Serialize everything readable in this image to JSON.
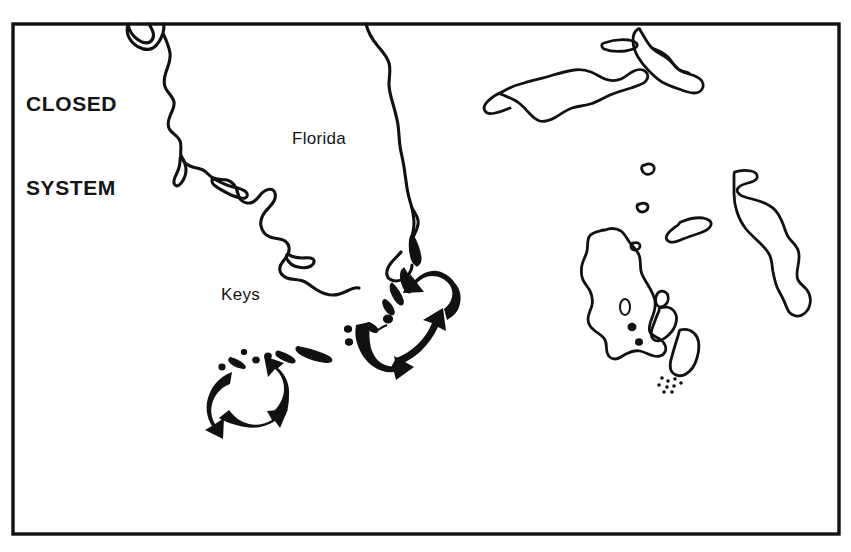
{
  "figure": {
    "kind": "line-drawing-map",
    "caption_title": "CLOSED SYSTEM",
    "title_line_1": "CLOSED",
    "title_line_2": "SYSTEM",
    "background_color": "#ffffff",
    "ink_color": "#111111",
    "border_color": "#111111",
    "width": 851,
    "height": 552
  },
  "labels": {
    "florida": "Florida",
    "keys": "Keys"
  },
  "map_features": {
    "coastlines": [
      "west-florida-coast",
      "east-florida-coast",
      "florida-keys-chain",
      "grand-bahama",
      "little-bahama-bank-cay",
      "abaco",
      "eleuthera",
      "andros",
      "new-providence",
      "exuma-cays",
      "small-cays"
    ],
    "circulation_gyres": [
      {
        "name": "upper-gyre",
        "location": "straits-of-florida",
        "direction": "counterclockwise",
        "arrow_count": 3
      },
      {
        "name": "lower-gyre",
        "location": "lower-keys",
        "direction": "counterclockwise",
        "arrow_count": 3
      }
    ]
  }
}
